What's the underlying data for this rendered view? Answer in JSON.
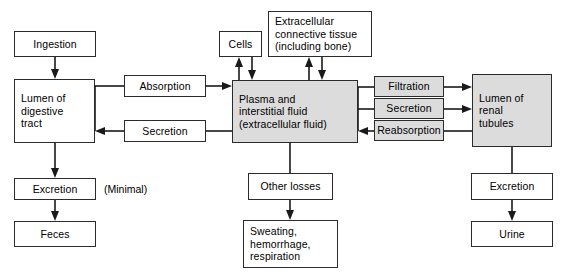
{
  "diagram": {
    "colors": {
      "shaded_fill": "#dcdcdc",
      "plain_fill": "#ffffff",
      "stroke": "#2b2b2b",
      "arrow": "#1a1a1a"
    },
    "nodes": [
      {
        "id": "ingestion",
        "label": "Ingestion",
        "shaded": false
      },
      {
        "id": "lumen_gi",
        "label": "Lumen of\ndigestive\ntract",
        "shaded": false
      },
      {
        "id": "absorption",
        "label": "Absorption",
        "shaded": false
      },
      {
        "id": "secretion_gi",
        "label": "Secretion",
        "shaded": false
      },
      {
        "id": "excretion_gi",
        "label": "Excretion",
        "shaded": false
      },
      {
        "id": "feces",
        "label": "Feces",
        "shaded": false
      },
      {
        "id": "cells",
        "label": "Cells",
        "shaded": false
      },
      {
        "id": "ect",
        "label": "Extracellular\nconnective tissue\n(including bone)",
        "shaded": false
      },
      {
        "id": "plasma",
        "label": "Plasma and\ninterstitial fluid\n(extracellular fluid)",
        "shaded": true
      },
      {
        "id": "other_losses",
        "label": "Other losses",
        "shaded": false
      },
      {
        "id": "sweating",
        "label": "Sweating,\nhemorrhage,\nrespiration",
        "shaded": false
      },
      {
        "id": "filtration",
        "label": "Filtration",
        "shaded": true
      },
      {
        "id": "secretion_ren",
        "label": "Secretion",
        "shaded": true
      },
      {
        "id": "reabsorption",
        "label": "Reabsorption",
        "shaded": true
      },
      {
        "id": "lumen_renal",
        "label": "Lumen of\nrenal\ntubules",
        "shaded": true
      },
      {
        "id": "excretion_ren",
        "label": "Excretion",
        "shaded": false
      },
      {
        "id": "urine",
        "label": "Urine",
        "shaded": false
      }
    ],
    "annotations": [
      {
        "id": "minimal",
        "text": "(Minimal)"
      }
    ]
  }
}
